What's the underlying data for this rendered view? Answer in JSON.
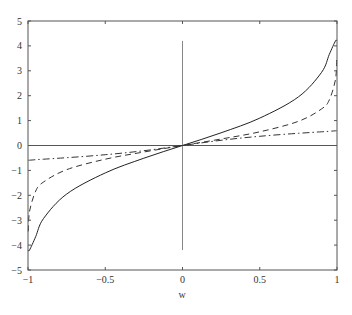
{
  "chart_data": {
    "type": "line",
    "title": "",
    "xlabel": "w",
    "ylabel": "",
    "xlim": [
      -1,
      1
    ],
    "ylim": [
      -5,
      5
    ],
    "grid": false,
    "legend": null,
    "x_ticks": [
      -1,
      -0.5,
      0,
      0.5,
      1
    ],
    "x_tick_labels": [
      "−1",
      "−0.5",
      "0",
      "0.5",
      "1"
    ],
    "y_ticks": [
      -5,
      -4,
      -3,
      -2,
      -1,
      0,
      1,
      2,
      3,
      4,
      5
    ],
    "y_tick_labels": [
      "−5",
      "−4",
      "−3",
      "−2",
      "−1",
      "0",
      "1",
      "2",
      "3",
      "4",
      "5"
    ],
    "reference_lines": [
      {
        "orientation": "horizontal",
        "y": 0,
        "x_range": [
          -1,
          1
        ],
        "color": "#555555"
      },
      {
        "orientation": "vertical",
        "x": 0,
        "y_range": [
          -4.2,
          4.2
        ],
        "color": "#888888"
      }
    ],
    "x": [
      -0.998,
      -0.99,
      -0.95,
      -0.9,
      -0.75,
      -0.5,
      -0.25,
      0,
      0.25,
      0.5,
      0.75,
      0.9,
      0.95,
      0.99,
      0.998
    ],
    "series": [
      {
        "name": "solid",
        "style": "solid",
        "color": "#222222",
        "values": [
          -4.2,
          -4.2,
          -3.66,
          -2.94,
          -1.95,
          -1.1,
          -0.51,
          0,
          0.51,
          1.1,
          1.95,
          2.94,
          3.66,
          4.2,
          4.2
        ]
      },
      {
        "name": "dashed",
        "style": "dashed",
        "color": "#333333",
        "values": [
          -3.45,
          -2.65,
          -1.83,
          -1.47,
          -0.97,
          -0.55,
          -0.26,
          0,
          0.26,
          0.55,
          0.97,
          1.47,
          1.83,
          2.65,
          3.45
        ]
      },
      {
        "name": "dash-dot",
        "style": "dashdot",
        "color": "#333333",
        "values": [
          -0.59,
          -0.59,
          -0.57,
          -0.55,
          -0.49,
          -0.37,
          -0.21,
          0,
          0.21,
          0.37,
          0.49,
          0.55,
          0.57,
          0.59,
          0.59
        ]
      }
    ]
  }
}
